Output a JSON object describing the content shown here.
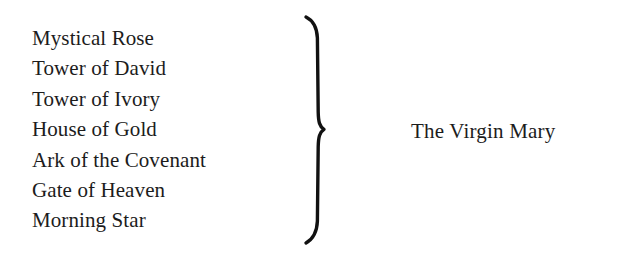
{
  "figure": {
    "background_color": "#ffffff",
    "ink_color": "#1c1c1c",
    "brace_icon": "right-curly-brace",
    "titles": [
      {
        "label": "Mystical Rose"
      },
      {
        "label": "Tower of David"
      },
      {
        "label": "Tower of Ivory"
      },
      {
        "label": "House of Gold"
      },
      {
        "label": "Ark of the Covenant"
      },
      {
        "label": "Gate of Heaven"
      },
      {
        "label": "Morning Star"
      }
    ],
    "group_label": "The Virgin Mary"
  }
}
